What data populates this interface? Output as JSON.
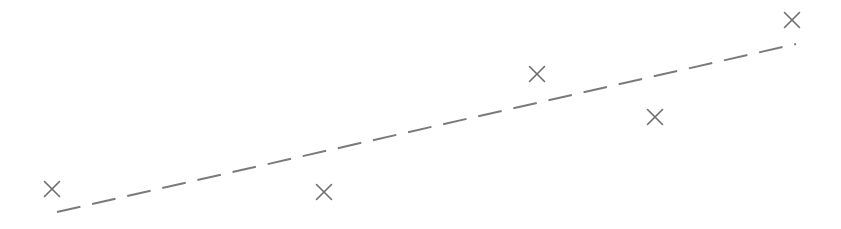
{
  "chart_data": {
    "type": "scatter",
    "title": "",
    "xlabel": "",
    "ylabel": "",
    "grid": false,
    "legend": null,
    "coordinate_space": "pixels (origin top-left, y grows downward)",
    "width": 841,
    "height": 229,
    "series": [
      {
        "name": "points",
        "marker": "x",
        "marker_size": 20,
        "color": "#6e6e6e",
        "points": [
          {
            "x": 52,
            "y": 189
          },
          {
            "x": 324,
            "y": 192
          },
          {
            "x": 537,
            "y": 74
          },
          {
            "x": 655,
            "y": 117
          },
          {
            "x": 792,
            "y": 20
          }
        ]
      },
      {
        "name": "trend-line",
        "kind": "line",
        "style": "dashed",
        "dash": [
          24,
          12
        ],
        "color": "#7a7a7a",
        "stroke_width": 2,
        "start": {
          "x": 57,
          "y": 212
        },
        "end": {
          "x": 796,
          "y": 44
        }
      }
    ]
  }
}
